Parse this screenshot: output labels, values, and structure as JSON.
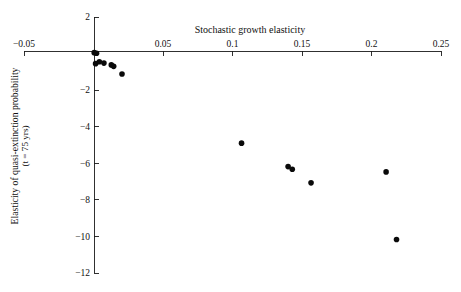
{
  "chart_data": {
    "type": "scatter",
    "title": "",
    "xlabel": "Stochastic growth elasticity",
    "ylabel_line1": "Elasticity of quasi-extinction probability",
    "ylabel_line2": "(t = 75 yrs)",
    "ylabel_line2_italic_symbol": "t",
    "xlim": [
      -0.05,
      0.25
    ],
    "ylim": [
      -12,
      2
    ],
    "grid": false,
    "legend": null,
    "xticks": [
      -0.05,
      0,
      0.05,
      0.1,
      0.15,
      0.2,
      0.25
    ],
    "xtick_labels": [
      "−0.05",
      "",
      "0.05",
      "0.1",
      "0.15",
      "0.2",
      "0.25"
    ],
    "yticks": [
      2,
      0,
      -2,
      -4,
      -6,
      -8,
      -10,
      -12
    ],
    "ytick_labels": [
      "2",
      "",
      "−2",
      "−4",
      "−6",
      "−8",
      "−10",
      "−12"
    ],
    "marker": "filled-circle",
    "marker_color": "#0a0a0a",
    "axis_color": "#1a1a1a",
    "points": [
      {
        "x": 0.0005,
        "y": 0.05
      },
      {
        "x": 0.0022,
        "y": 0.02
      },
      {
        "x": 0.0015,
        "y": -0.55
      },
      {
        "x": 0.0042,
        "y": -0.45
      },
      {
        "x": 0.0075,
        "y": -0.52
      },
      {
        "x": 0.0128,
        "y": -0.62
      },
      {
        "x": 0.0145,
        "y": -0.7
      },
      {
        "x": 0.0205,
        "y": -1.12
      },
      {
        "x": 0.1065,
        "y": -4.9
      },
      {
        "x": 0.14,
        "y": -6.18
      },
      {
        "x": 0.143,
        "y": -6.33
      },
      {
        "x": 0.1565,
        "y": -7.07
      },
      {
        "x": 0.2105,
        "y": -6.47
      },
      {
        "x": 0.218,
        "y": -10.17
      }
    ]
  },
  "axes_geometry": {
    "x_px_min": 24,
    "x_px_max": 441,
    "y_px_top": 17,
    "y_px_bottom": 273,
    "x_axis_y_px": 51,
    "y_axis_x_px": 94,
    "tick_len": 5,
    "marker_radius": 2.8
  },
  "meta": {
    "xaxis_title_text": "Stochastic growth elasticity"
  }
}
